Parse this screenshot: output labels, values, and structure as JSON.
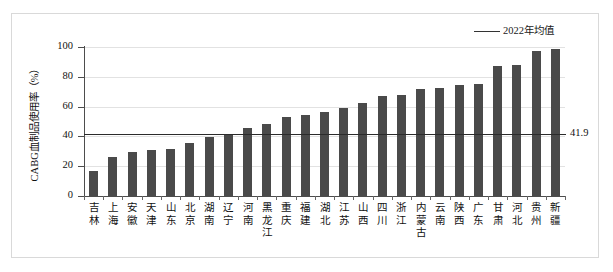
{
  "chart_data": {
    "type": "bar",
    "title": "",
    "subtitle": "",
    "xlabel": "",
    "ylabel": "CABG血制品使用率（%）",
    "ylim": [
      0,
      100
    ],
    "yticks": [
      0,
      20,
      40,
      60,
      80,
      100
    ],
    "grid": true,
    "legend_position": "top-right",
    "categories": [
      "吉林",
      "上海",
      "安徽",
      "天津",
      "山东",
      "北京",
      "湖南",
      "辽宁",
      "河南",
      "黑龙江",
      "重庆",
      "福建",
      "湖北",
      "江苏",
      "山西",
      "四川",
      "浙江",
      "内蒙古",
      "云南",
      "陕西",
      "广东",
      "甘肃",
      "河北",
      "贵州",
      "新疆"
    ],
    "values": [
      16.5,
      26.0,
      29.8,
      31.2,
      31.5,
      35.5,
      39.3,
      41.5,
      45.8,
      48.0,
      53.3,
      54.3,
      56.5,
      58.8,
      62.5,
      66.8,
      68.0,
      72.0,
      72.8,
      74.8,
      75.0,
      87.0,
      88.0,
      97.5,
      98.5
    ],
    "series": [
      {
        "name": "CABG血制品使用率",
        "color": "#4a4a4a",
        "values": [
          16.5,
          26.0,
          29.8,
          31.2,
          31.5,
          35.5,
          39.3,
          41.5,
          45.8,
          48.0,
          53.3,
          54.3,
          56.5,
          58.8,
          62.5,
          66.8,
          68.0,
          72.0,
          72.8,
          74.8,
          75.0,
          87.0,
          88.0,
          97.5,
          98.5
        ]
      }
    ],
    "reference_line": {
      "label": "2022年均值",
      "value": 41.9,
      "value_label": "41.9",
      "color": "#2b2b2b"
    },
    "legend": [
      {
        "label": "2022年均值",
        "marker": "line",
        "color": "#2b2b2b"
      }
    ],
    "colors": {
      "bar": "#4a4a4a",
      "gridline": "#e2e2e2",
      "axis": "#4d4d4d",
      "frame": "#d9d9d9",
      "reference_line": "#2b2b2b"
    }
  }
}
